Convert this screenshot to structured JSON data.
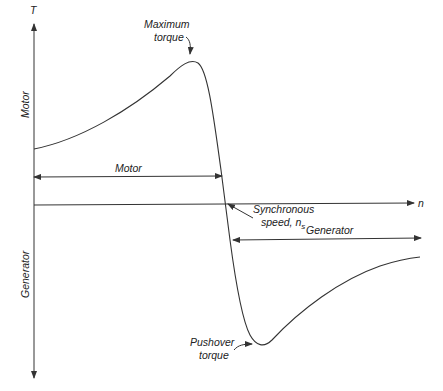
{
  "diagram": {
    "axes": {
      "y_label": "T",
      "x_label": "n",
      "y_upper_region_label": "Motor",
      "y_lower_region_label": "Generator"
    },
    "annotations": {
      "max_torque_line1": "Maximum",
      "max_torque_line2": "torque",
      "sync_speed_line1": "Synchronous",
      "sync_speed_line2": "speed, n",
      "sync_speed_subscript": "s",
      "pushover_line1": "Pushover",
      "pushover_line2": "torque"
    },
    "ranges": {
      "motor_label": "Motor",
      "generator_label": "Generator"
    },
    "colors": {
      "ink": "#333333",
      "background": "#ffffff"
    }
  }
}
